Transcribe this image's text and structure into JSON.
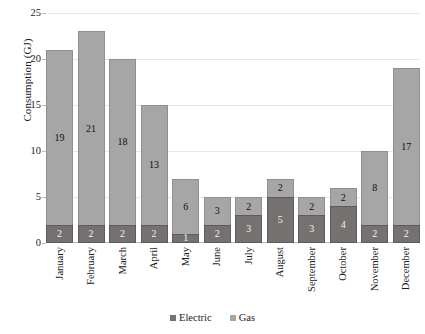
{
  "chart_data": {
    "type": "bar",
    "subtype": "stacked-column",
    "title": "",
    "xlabel": "",
    "ylabel": "Consumption (GJ)",
    "ylim": [
      0,
      25
    ],
    "yticks": [
      0,
      5,
      10,
      15,
      20,
      25
    ],
    "ytick_labels": [
      "0",
      "5",
      "10",
      "15",
      "20",
      "25"
    ],
    "grid": true,
    "grid_axis": "y",
    "legend_position": "bottom-center",
    "categories": [
      "January",
      "February",
      "March",
      "April",
      "May",
      "June",
      "July",
      "August",
      "September",
      "October",
      "November",
      "December"
    ],
    "series": [
      {
        "name": "Electric",
        "color": "#767171",
        "values": [
          2,
          2,
          2,
          2,
          1,
          2,
          3,
          5,
          3,
          4,
          2,
          2
        ],
        "labels": [
          "2",
          "2",
          "2",
          "2",
          "1",
          "2",
          "3",
          "5",
          "3",
          "4",
          "2",
          "2"
        ]
      },
      {
        "name": "Gas",
        "color": "#A6A6A6",
        "values": [
          19,
          21,
          18,
          13,
          6,
          3,
          2,
          2,
          2,
          2,
          8,
          17
        ],
        "labels": [
          "19",
          "21",
          "18",
          "13",
          "6",
          "3",
          "2",
          "2",
          "2",
          "2",
          "8",
          "17"
        ]
      }
    ],
    "totals": [
      21,
      23,
      20,
      15,
      7,
      5,
      5,
      7,
      5,
      6,
      10,
      19
    ]
  },
  "legend": {
    "entries": [
      {
        "label": "Electric",
        "color": "#767171"
      },
      {
        "label": "Gas",
        "color": "#A6A6A6"
      }
    ]
  }
}
